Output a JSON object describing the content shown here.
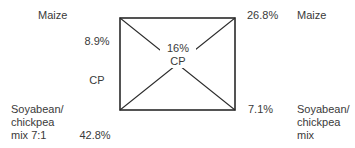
{
  "diagram": {
    "type": "pearson-square",
    "center": {
      "value": "16%",
      "unit": "CP"
    },
    "corners": {
      "top_left": {
        "feed": "Maize",
        "value": "8.9%",
        "unit": "CP"
      },
      "bottom_left": {
        "feed": "Soyabean/\nchickpea\nmix 7:1",
        "value": "42.8%",
        "unit": "CP"
      },
      "top_right": {
        "feed": "Maize",
        "value": "26.8%"
      },
      "bottom_right": {
        "feed": "Soyabean/\nchickpea\nmix",
        "value": "7.1%"
      }
    },
    "colors": {
      "line": "#2a2a2a",
      "text": "#3a3a3a",
      "background": "#ffffff"
    }
  }
}
